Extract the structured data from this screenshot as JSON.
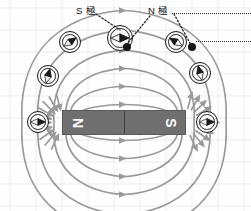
{
  "diagram": {
    "title_labels": [
      {
        "id": "s-pole-label",
        "text": "S 極",
        "x": 76,
        "y": 4
      },
      {
        "id": "n-pole-label",
        "text": "N 極",
        "x": 148,
        "y": 4
      }
    ],
    "magnet": {
      "x": 62,
      "y": 110,
      "width": 124,
      "height": 25,
      "fill": "#6f6f6f",
      "left_pole": "N",
      "right_pole": "S",
      "letter_color": "#ffffff",
      "letter_rotation_deg": 90
    },
    "field_line_color": "#9a9a9a",
    "grid_color": "#e8ecee",
    "compasses": [
      {
        "id": "compass-left-outer",
        "cx": 38,
        "cy": 122,
        "r": 11,
        "needle_angle": 0
      },
      {
        "id": "compass-right-outer",
        "cx": 207,
        "cy": 122,
        "r": 11,
        "needle_angle": 0
      },
      {
        "id": "compass-left-mid",
        "cx": 48,
        "cy": 76,
        "r": 11,
        "needle_angle": 75
      },
      {
        "id": "compass-right-mid",
        "cx": 200,
        "cy": 73,
        "r": 11,
        "needle_angle": 105
      },
      {
        "id": "compass-left-upper",
        "cx": 70,
        "cy": 42,
        "r": 11,
        "needle_angle": 35
      },
      {
        "id": "compass-right-upper",
        "cx": 176,
        "cy": 42,
        "r": 11,
        "needle_angle": 148
      },
      {
        "id": "compass-top-center",
        "cx": 120,
        "cy": 38,
        "r": 13,
        "needle_angle": 0
      }
    ],
    "pivot_dots": [
      {
        "id": "pivot-dot-center",
        "cx": 127,
        "cy": 47,
        "r": 4
      },
      {
        "id": "pivot-dot-right",
        "cx": 192,
        "cy": 47,
        "r": 4
      }
    ],
    "leader_lines": [
      {
        "id": "leader-s-pole",
        "x1": 96,
        "y1": 14,
        "x2": 120,
        "y2": 30
      },
      {
        "id": "leader-n-pole-a",
        "x1": 150,
        "y1": 16,
        "x2": 126,
        "y2": 45
      },
      {
        "id": "leader-n-pole-b",
        "x1": 174,
        "y1": 14,
        "x2": 191,
        "y2": 45
      }
    ],
    "callout_dotted_rows": [
      {
        "id": "callout-row-top",
        "x": 172,
        "y": 13,
        "width": 79
      },
      {
        "id": "callout-row-bottom",
        "x": 196,
        "y": 41,
        "width": 55
      }
    ]
  }
}
